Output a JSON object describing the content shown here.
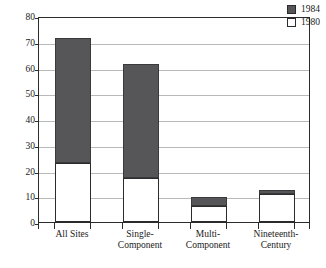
{
  "chart_data": {
    "type": "bar",
    "stacked": true,
    "title": "",
    "subtitle": "",
    "xlabel": "",
    "ylabel": "",
    "categories": [
      "All Sites",
      "Single-Component",
      "Multi-Component",
      "Nineteenth-Century"
    ],
    "category_lines": [
      [
        "All Sites"
      ],
      [
        "Single-",
        "Component"
      ],
      [
        "Multi-",
        "Component"
      ],
      [
        "Nineteenth-",
        "Century"
      ]
    ],
    "series": [
      {
        "name": "1980",
        "values": [
          23,
          17,
          6.3,
          10.8
        ]
      },
      {
        "name": "1984",
        "values": [
          71.3,
          61.3,
          9.8,
          12.3
        ]
      }
    ],
    "ylim": [
      0,
      80
    ],
    "yticks": [
      0,
      10,
      20,
      30,
      40,
      50,
      60,
      70,
      80
    ],
    "ytick_labels": [
      "0",
      "10",
      "20",
      "30",
      "40",
      "50",
      "60",
      "70",
      "80"
    ],
    "grid": true,
    "legend_position": "top-right",
    "legend": [
      {
        "label": "1984",
        "swatch": "filled"
      },
      {
        "label": "1980",
        "swatch": "open"
      }
    ],
    "colors": {
      "series_1984": "#565659",
      "series_1980": "#ffffff",
      "outline": "#2b2b2b",
      "gridline": "#b9b9b9",
      "background": "#ffffff",
      "text": "#1a1a1a"
    }
  }
}
